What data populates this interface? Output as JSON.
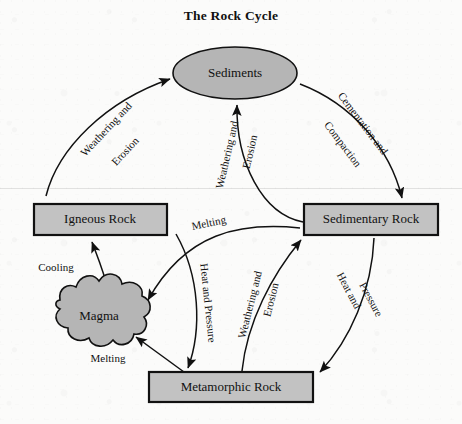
{
  "title": "The Rock Cycle",
  "colors": {
    "node_fill": "#b5b5b5",
    "box_fill": "#c2c2c2",
    "stroke": "#111111",
    "background": "#fbfbfa"
  },
  "nodes": [
    {
      "id": "sediments",
      "label": "Sediments",
      "shape": "ellipse",
      "cx": 235,
      "cy": 73
    },
    {
      "id": "igneous",
      "label": "Igneous Rock",
      "shape": "rect",
      "cx": 100,
      "cy": 219
    },
    {
      "id": "sedimentary",
      "label": "Sedimentary Rock",
      "shape": "rect",
      "cx": 371,
      "cy": 219
    },
    {
      "id": "magma",
      "label": "Magma",
      "shape": "blob",
      "cx": 99,
      "cy": 317
    },
    {
      "id": "metamorphic",
      "label": "Metamorphic Rock",
      "shape": "rect",
      "cx": 231,
      "cy": 387
    }
  ],
  "edges": [
    {
      "id": "igneous-to-sediments",
      "from": "igneous",
      "to": "sediments",
      "label_lines": [
        "Weathering and",
        "Erosion"
      ]
    },
    {
      "id": "sediments-to-sedimentary",
      "from": "sediments",
      "to": "sedimentary",
      "label_lines": [
        "Cementation and",
        "Compaction"
      ]
    },
    {
      "id": "sedimentary-to-sediments",
      "from": "sedimentary",
      "to": "sediments",
      "label_lines": [
        "Weathering and",
        "Erosion"
      ]
    },
    {
      "id": "metamorphic-to-sedimentary",
      "from": "metamorphic",
      "to": "sedimentary",
      "label_lines": [
        "Weathering and",
        "Erosion"
      ]
    },
    {
      "id": "sedimentary-to-metamorphic",
      "from": "sedimentary",
      "to": "metamorphic",
      "label_lines": [
        "Heat and",
        "Pressure"
      ]
    },
    {
      "id": "igneous-to-metamorphic",
      "from": "igneous",
      "to": "metamorphic",
      "label_lines": [
        "Heat and Pressure"
      ]
    },
    {
      "id": "sedimentary-to-magma",
      "from": "sedimentary",
      "to": "magma",
      "label_lines": [
        "Melting"
      ]
    },
    {
      "id": "metamorphic-to-magma",
      "from": "metamorphic",
      "to": "magma",
      "label_lines": [
        "Melting"
      ]
    },
    {
      "id": "magma-to-igneous",
      "from": "magma",
      "to": "igneous",
      "label_lines": [
        "Cooling"
      ]
    }
  ],
  "edge_labels": {
    "weathering_erosion_left_1": "Weathering and",
    "weathering_erosion_left_2": "Erosion",
    "cementation_1": "Cementation and",
    "cementation_2": "Compaction",
    "weathering_erosion_center_1": "Weathering and",
    "weathering_erosion_center_2": "Erosion",
    "weathering_erosion_lower_1": "Weathering and",
    "weathering_erosion_lower_2": "Erosion",
    "heat_pressure_right_1": "Heat and",
    "heat_pressure_right_2": "Pressure",
    "heat_pressure_left": "Heat and Pressure",
    "melting_upper": "Melting",
    "melting_lower": "Melting",
    "cooling": "Cooling"
  }
}
